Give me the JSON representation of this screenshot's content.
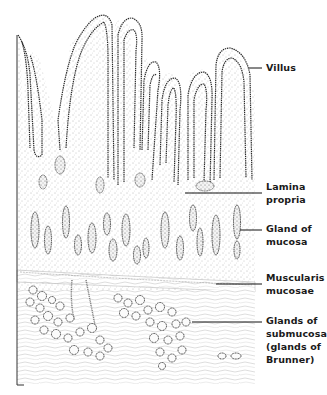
{
  "figure": {
    "labels": [
      {
        "id": "villus",
        "lines": [
          "Villus"
        ],
        "leader_y": 68
      },
      {
        "id": "lamina-propria",
        "lines": [
          "Lamina",
          "propria"
        ],
        "leader_y": 193
      },
      {
        "id": "gland-of-mucosa",
        "lines": [
          "Gland of",
          "mucosa"
        ],
        "leader_y": 230
      },
      {
        "id": "muscularis-mucosae",
        "lines": [
          "Muscularis",
          "mucosae"
        ],
        "leader_y": 284
      },
      {
        "id": "glands-of-submucosa",
        "lines": [
          "Glands of",
          "submucosa",
          "(glands of",
          "Brunner)"
        ],
        "leader_y": 322
      }
    ],
    "colors": {
      "ink": "#1a1a1a",
      "stipple": "#6a6a6a",
      "background": "#ffffff"
    }
  }
}
